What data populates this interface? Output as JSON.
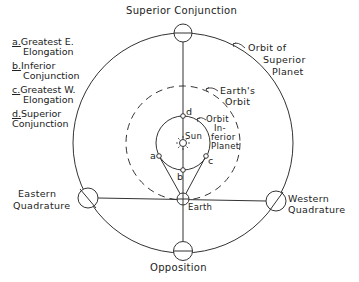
{
  "diagram": {
    "title": "Superior Conjunction",
    "labels": {
      "superior_conjunction": "Superior Conjunction",
      "opposition": "Opposition",
      "eastern_quadrature_1": "Eastern",
      "eastern_quadrature_2": "Quadrature",
      "western_quadrature_1": "Western",
      "western_quadrature_2": "Quadrature",
      "earth": "Earth",
      "sun": "Sun",
      "orbit_superior_1": "Orbit of",
      "orbit_superior_2": "Superior",
      "orbit_superior_3": "Planet",
      "earth_orbit_1": "Earth's",
      "earth_orbit_2": "Orbit",
      "orbit_inferior_1": "Orbit",
      "orbit_inferior_2": "In-",
      "orbit_inferior_3": "ferior",
      "orbit_inferior_4": "Planet",
      "point_a": "a",
      "point_b": "b",
      "point_c": "c",
      "point_d": "d"
    },
    "legend": [
      {
        "key": "a.",
        "line1": "Greatest E.",
        "line2": "Elongation"
      },
      {
        "key": "b.",
        "line1": "Inferior",
        "line2": "Conjunction"
      },
      {
        "key": "c.",
        "line1": "Greatest W.",
        "line2": "Elongation"
      },
      {
        "key": "d.",
        "line1": "Superior",
        "line2": "Conjunction"
      }
    ],
    "colors": {
      "stroke": "#333333",
      "background": "#ffffff"
    }
  }
}
